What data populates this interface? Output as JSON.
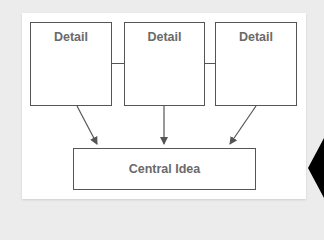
{
  "diagram": {
    "type": "concept-map",
    "details": [
      {
        "label": "Detail"
      },
      {
        "label": "Detail"
      },
      {
        "label": "Detail"
      }
    ],
    "central": {
      "label": "Central Idea"
    },
    "connections": [
      {
        "from": "details.0",
        "to": "central"
      },
      {
        "from": "details.1",
        "to": "central"
      },
      {
        "from": "details.2",
        "to": "central"
      }
    ],
    "colors": {
      "background": "#ececec",
      "card": "#ffffff",
      "stroke": "#555555",
      "text": "#6a6a6a",
      "pointer": "#000000"
    }
  }
}
